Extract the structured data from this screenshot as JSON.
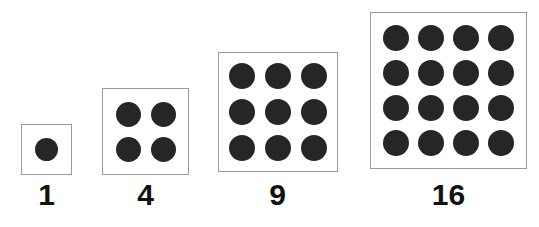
{
  "figure": {
    "background_color": "#ffffff",
    "dot_color": "#262626",
    "box_border_color": "#9a9a9a",
    "label_color": "#111111"
  },
  "chart_data": {
    "type": "diagram",
    "categories": [
      "1",
      "4",
      "9",
      "16"
    ],
    "values": [
      1,
      4,
      9,
      16
    ],
    "xlabel": "",
    "ylabel": "",
    "grid": false,
    "legend": null,
    "series": [
      {
        "name": "square numbers",
        "values": [
          1,
          4,
          9,
          16
        ]
      }
    ],
    "annotations": [
      "1 = 1 x 1",
      "4 = 2 x 2",
      "9 = 3 x 3",
      "16 = 4 x 4"
    ]
  },
  "groups": [
    {
      "label": "1",
      "side": 1,
      "count": 1,
      "box_left": 21,
      "box_top": 124,
      "box_size": 51,
      "dot_size": 23,
      "dot_gap": 6,
      "label_left": 11,
      "label_top": 180,
      "label_width": 71,
      "label_size": 30
    },
    {
      "label": "4",
      "side": 2,
      "count": 4,
      "box_left": 102,
      "box_top": 88,
      "box_size": 87,
      "dot_size": 25,
      "dot_gap": 10,
      "label_left": 110,
      "label_top": 180,
      "label_width": 71,
      "label_size": 30
    },
    {
      "label": "9",
      "side": 3,
      "count": 9,
      "box_left": 218,
      "box_top": 52,
      "box_size": 120,
      "dot_size": 26,
      "dot_gap": 10,
      "label_left": 242,
      "label_top": 180,
      "label_width": 71,
      "label_size": 30
    },
    {
      "label": "16",
      "side": 4,
      "count": 16,
      "box_left": 370,
      "box_top": 12,
      "box_size": 157,
      "dot_size": 26,
      "dot_gap": 9,
      "label_left": 413,
      "label_top": 180,
      "label_width": 71,
      "label_size": 30
    }
  ]
}
